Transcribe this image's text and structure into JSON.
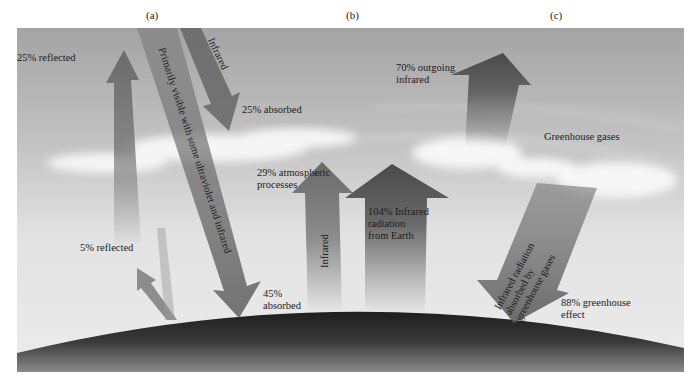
{
  "panels": {
    "a": "(a)",
    "b": "(b)",
    "c": "(c)"
  },
  "labels": {
    "reflected_25": "25% reflected",
    "primarily_visible": "Primarily visible with some ultraviolet and infrared",
    "infrared_top": "Infrared",
    "absorbed_25": "25% absorbed",
    "reflected_5": "5% reflected",
    "absorbed_45_line1": "45%",
    "absorbed_45_line2": "absorbed",
    "atmospheric_line1": "29% atmospheric",
    "atmospheric_line2": "processes",
    "infrared_mid": "Infrared",
    "earth_ir_line1": "104% Infrared",
    "earth_ir_line2": "radiation",
    "earth_ir_line3": "from Earth",
    "outgoing_line1": "70% outgoing",
    "outgoing_line2": "infrared",
    "greenhouse_gases": "Greenhouse gases",
    "absorbed_gh_line1": "Infrared radiation",
    "absorbed_gh_line2": "absorbed by",
    "absorbed_gh_line3": "greenhouse gases",
    "greenhouse_effect_line1": "88% greenhouse",
    "greenhouse_effect_line2": "effect"
  },
  "colors": {
    "sky_top": "#a9a9a9",
    "sky_bottom": "#e6e6e6",
    "arrow": "#6e6e6e",
    "earth": "#2a2a2a",
    "cloud": "#f4f4f4"
  }
}
